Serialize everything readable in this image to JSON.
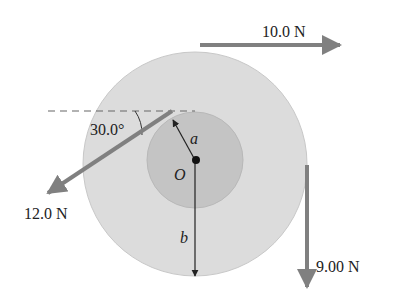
{
  "diagram": {
    "forces": {
      "top": {
        "label": "10.0 N",
        "direction": "right"
      },
      "left": {
        "label": "12.0 N",
        "angle_label": "30.0°",
        "direction": "down-left"
      },
      "right": {
        "label": "9.00 N",
        "direction": "down"
      }
    },
    "labels": {
      "center": "O",
      "inner_radius": "a",
      "outer_radius": "b"
    },
    "colors": {
      "outer_disk": "#dcdcdc",
      "inner_disk": "#c4c4c4",
      "arrow": "#808080",
      "line": "#222222"
    }
  }
}
